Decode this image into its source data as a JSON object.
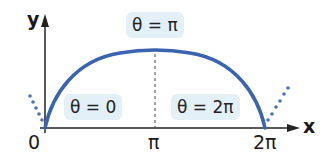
{
  "diagram": {
    "axes": {
      "x_label": "x",
      "y_label": "y",
      "origin_label": "0"
    },
    "ticks": [
      {
        "label": "π"
      },
      {
        "label": "2π"
      }
    ],
    "annotations": [
      {
        "label": "θ = 0"
      },
      {
        "label": "θ = π"
      },
      {
        "label": "θ = 2π"
      }
    ],
    "colors": {
      "curve": "#3a64b0",
      "dotted": "#4a72b8",
      "axis": "#222222",
      "label_bg": "#e4f0f8"
    }
  }
}
